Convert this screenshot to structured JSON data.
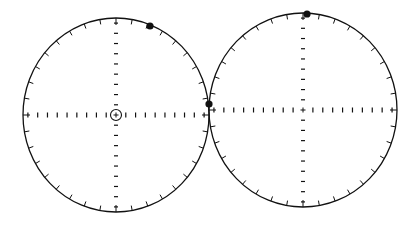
{
  "diagram": {
    "type": "polar-stereonet-pair",
    "stroke_color": "#111111",
    "background": "#ffffff",
    "circles": [
      {
        "id": "left",
        "cx": 116,
        "cy": 115,
        "rx": 93,
        "ry": 97,
        "rim_ticks": 36,
        "axis_ticks_per_half": 9,
        "center_marker": "circled-plus",
        "dots": [
          {
            "x": 150,
            "y": 26
          },
          {
            "x": 209,
            "y": 104
          }
        ]
      },
      {
        "id": "right",
        "cx": 303,
        "cy": 110,
        "rx": 94,
        "ry": 97,
        "rim_ticks": 36,
        "axis_ticks_per_half": 9,
        "center_marker": "plus",
        "dots": [
          {
            "x": 307,
            "y": 14
          }
        ]
      }
    ]
  }
}
